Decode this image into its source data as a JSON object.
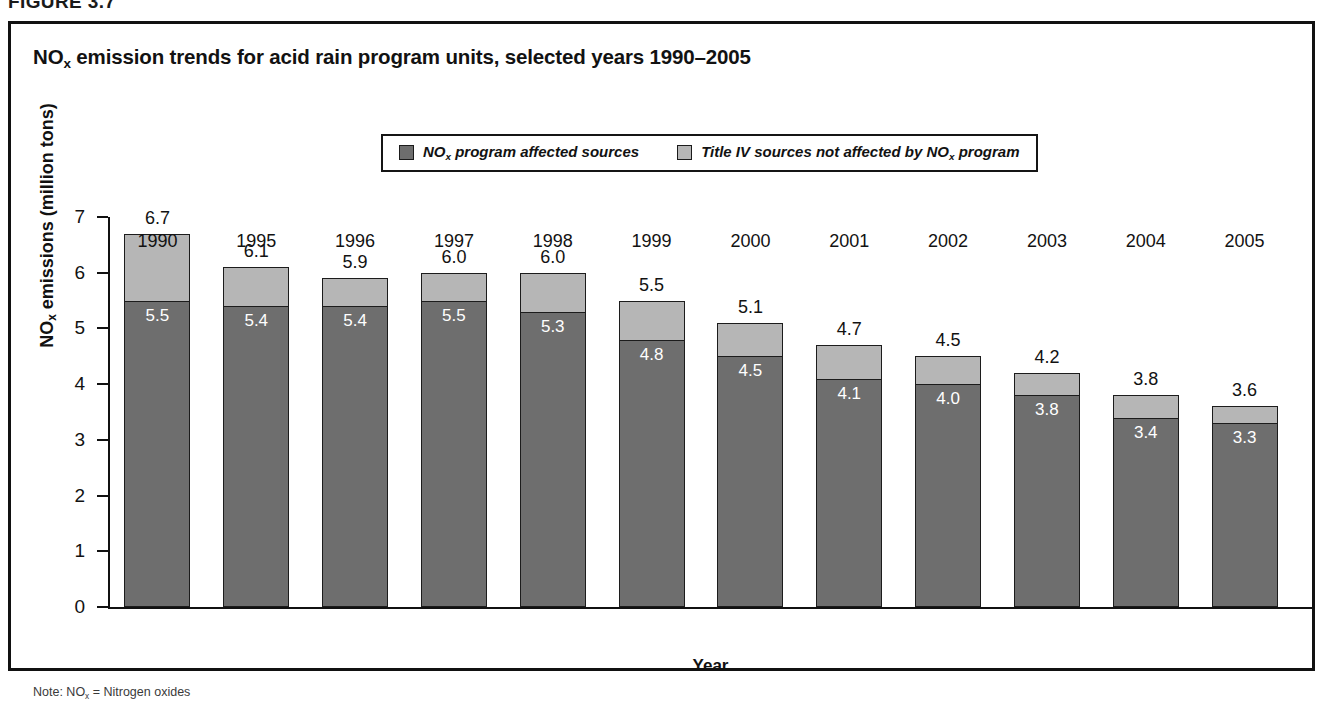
{
  "figure": {
    "number_label": "FIGURE 3.7",
    "note": "Note: NOx = Nitrogen oxides"
  },
  "chart_data": {
    "type": "bar",
    "subtype": "stacked-vertical",
    "title": "NOx emission trends for acid rain program units, selected years 1990–2005",
    "title_parts": {
      "prefix": "NO",
      "subscript": "x",
      "suffix": " emission trends for acid rain program units, selected years 1990–2005"
    },
    "xlabel": "Year",
    "ylabel": "NOx emissions (million tons)",
    "ylabel_parts": {
      "prefix": "NO",
      "subscript": "x",
      "suffix": " emissions (million tons)"
    },
    "ylim": [
      0,
      7
    ],
    "yticks": [
      0,
      1,
      2,
      3,
      4,
      5,
      6,
      7
    ],
    "ytick_labels": [
      "0",
      "1",
      "2",
      "3",
      "4",
      "5",
      "6",
      "7"
    ],
    "grid": false,
    "legend_position": "top-center",
    "categories": [
      "1990",
      "1995",
      "1996",
      "1997",
      "1998",
      "1999",
      "2000",
      "2001",
      "2002",
      "2003",
      "2004",
      "2005"
    ],
    "series": [
      {
        "name": "NOx program affected sources",
        "name_parts": {
          "prefix": "NO",
          "subscript": "x",
          "suffix": " program affected sources"
        },
        "color": "#6e6e6e",
        "values": [
          5.5,
          5.4,
          5.4,
          5.5,
          5.3,
          4.8,
          4.5,
          4.1,
          4.0,
          3.8,
          3.4,
          3.3
        ],
        "value_labels": [
          "5.5",
          "5.4",
          "5.4",
          "5.5",
          "5.3",
          "4.8",
          "4.5",
          "4.1",
          "4.0",
          "3.8",
          "3.4",
          "3.3"
        ]
      },
      {
        "name": "Title IV sources not affected by NOx program",
        "name_parts": {
          "prefix": "Title IV sources not affected by NO",
          "subscript": "x",
          "suffix": " program"
        },
        "color": "#b6b6b6",
        "values": [
          1.2,
          0.7,
          0.5,
          0.5,
          0.7,
          0.7,
          0.6,
          0.6,
          0.5,
          0.4,
          0.4,
          0.3
        ],
        "value_labels": [
          "",
          "",
          "",
          "",
          "",
          "",
          "",
          "",
          "",
          "",
          "",
          ""
        ]
      }
    ],
    "totals": [
      6.7,
      6.1,
      5.9,
      6.0,
      6.0,
      5.5,
      5.1,
      4.7,
      4.5,
      4.2,
      3.8,
      3.6
    ],
    "total_labels": [
      "6.7",
      "6.1",
      "5.9",
      "6.0",
      "6.0",
      "5.5",
      "5.1",
      "4.7",
      "4.5",
      "4.2",
      "3.8",
      "3.6"
    ]
  }
}
